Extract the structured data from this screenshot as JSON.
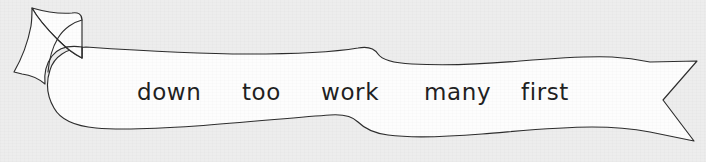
{
  "worksheet": {
    "type": "sight-word-banner",
    "background_color": "#ededed",
    "banner": {
      "fill_color": "#fdfdfd",
      "outline_color": "#2b2b2b",
      "left_end_style": "folded-ribbon-tail",
      "right_end_style": "swallowtail-notch",
      "shape_style": "hand-drawn-wavy-scroll"
    },
    "words": [
      {
        "text": "down"
      },
      {
        "text": "too"
      },
      {
        "text": "work"
      },
      {
        "text": "many"
      },
      {
        "text": "first"
      }
    ]
  }
}
